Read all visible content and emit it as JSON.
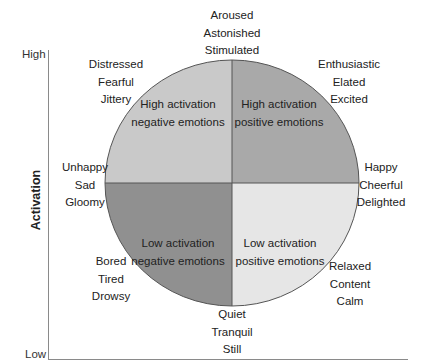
{
  "axis": {
    "title": "Activation",
    "high_label": "High",
    "low_label": "Low"
  },
  "colors": {
    "high_negative": "#c9c9c9",
    "high_positive": "#a9a9a9",
    "low_negative": "#909090",
    "low_positive": "#e6e6e6",
    "outline": "#555555"
  },
  "quadrants": {
    "high_negative": {
      "line1": "High activation",
      "line2": "negative emotions"
    },
    "high_positive": {
      "line1": "High activation",
      "line2": "positive emotions"
    },
    "low_negative": {
      "line1": "Low activation",
      "line2": "negative emotions"
    },
    "low_positive": {
      "line1": "Low activation",
      "line2": "positive emotions"
    }
  },
  "emotion_groups": {
    "top": [
      "Aroused",
      "Astonished",
      "Stimulated"
    ],
    "top_left": [
      "Distressed",
      "Fearful",
      "Jittery"
    ],
    "top_right": [
      "Enthusiastic",
      "Elated",
      "Excited"
    ],
    "left": [
      "Unhappy",
      "Sad",
      "Gloomy"
    ],
    "right": [
      "Happy",
      "Cheerful",
      "Delighted"
    ],
    "bottom_left": [
      "Bored",
      "Tired",
      "Drowsy"
    ],
    "bottom_right": [
      "Relaxed",
      "Content",
      "Calm"
    ],
    "bottom": [
      "Quiet",
      "Tranquil",
      "Still"
    ]
  }
}
